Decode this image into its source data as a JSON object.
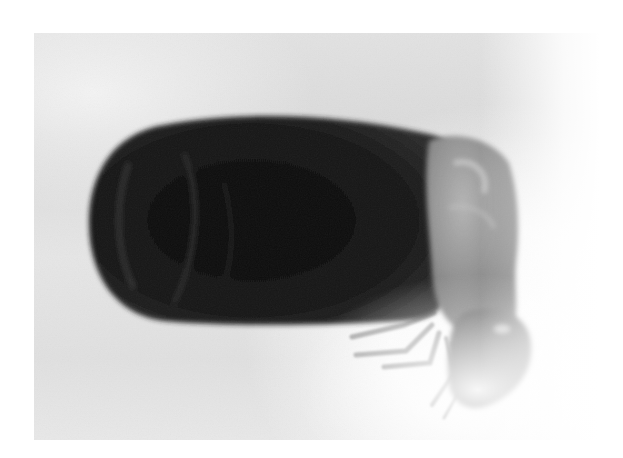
{
  "image": {
    "type": "photograph",
    "subject": "engorged arthropod specimen",
    "tone": "grayscale",
    "colors": {
      "background_light": "#ffffff",
      "background_gray": "#dedede",
      "body_dark": "#141414",
      "body_highlight": "#3a3a3a",
      "thorax_gray": "#8c8c8c",
      "head_gray": "#6e6e6e",
      "legs_gray": "#a8a8a8"
    },
    "alt_text": "Grayscale photograph of an engorged insect with a large dark swollen abdomen and a small grayish head with legs"
  }
}
